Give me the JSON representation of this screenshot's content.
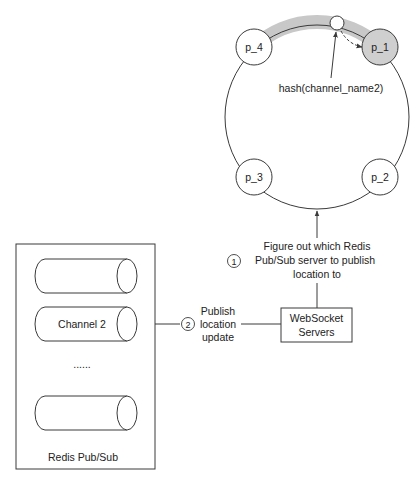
{
  "colors": {
    "line": "#3a3a3a",
    "band": "#c8c8c8",
    "highlight_node": "#cfcfcf",
    "background": "#ffffff",
    "text": "#222222"
  },
  "hash_ring": {
    "nodes": [
      {
        "id": "p_4",
        "label": "p_4",
        "highlighted": false
      },
      {
        "id": "p_1",
        "label": "p_1",
        "highlighted": true
      },
      {
        "id": "p_3",
        "label": "p_3",
        "highlighted": false
      },
      {
        "id": "p_2",
        "label": "p_2",
        "highlighted": false
      }
    ],
    "hash_label": "hash(channel_name2)"
  },
  "steps": {
    "step1": {
      "number": "1",
      "lines": [
        "Figure out which Redis",
        "Pub/Sub server to publish",
        "location to"
      ]
    },
    "step2": {
      "number": "2",
      "lines": [
        "Publish",
        "location",
        "update"
      ]
    }
  },
  "websocket": {
    "lines": [
      "WebSocket",
      "Servers"
    ]
  },
  "redis": {
    "title": "Redis Pub/Sub",
    "channels": [
      {
        "label": ""
      },
      {
        "label": "Channel 2"
      },
      {
        "label": ""
      }
    ],
    "ellipsis": "......"
  }
}
